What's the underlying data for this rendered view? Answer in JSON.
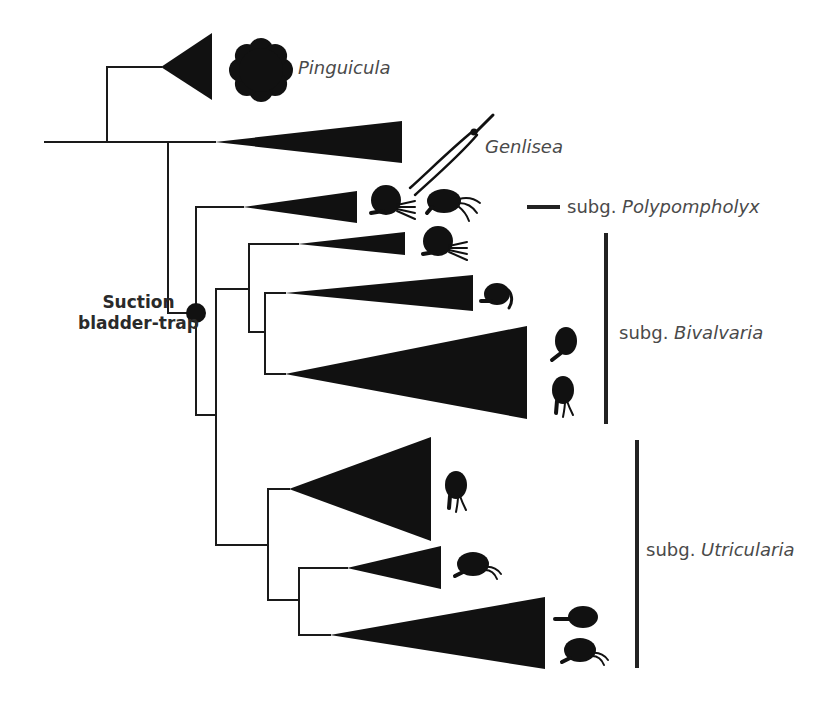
{
  "figure": {
    "width": 824,
    "height": 704,
    "line_color": "#1a1a1a",
    "fill_color": "#111111",
    "text_color": "#4a4a4a"
  },
  "tree": {
    "root_stem": {
      "x1": 45,
      "x2": 107,
      "y": 142
    },
    "branches": [
      {
        "name": "root-split",
        "vx": 107,
        "y1": 67,
        "y2": 142,
        "children_y": [
          67,
          142
        ]
      },
      {
        "name": "genlisea-utricularia-split",
        "vx": 168,
        "y1": 142,
        "y2": 313
      },
      {
        "name": "utricularia-crown",
        "vx": 196,
        "y1": 207,
        "y2": 415
      },
      {
        "name": "bivalvaria-utricularia-split",
        "vx": 216,
        "y1": 289,
        "y2": 545
      },
      {
        "name": "bivalvaria-crown",
        "vx": 249,
        "y1": 244,
        "y2": 332
      },
      {
        "name": "bivalvaria-inner",
        "vx": 265,
        "y1": 293,
        "y2": 374
      },
      {
        "name": "utricularia-subg-crown",
        "vx": 268,
        "y1": 489,
        "y2": 600
      },
      {
        "name": "utricularia-inner",
        "vx": 299,
        "y1": 568,
        "y2": 635
      }
    ],
    "clades": [
      {
        "id": "pinguicula",
        "stem_x": 107,
        "apex_x": 161,
        "apex_y": 67,
        "base_x": 212,
        "top_y": 33,
        "bottom_y": 100
      },
      {
        "id": "genlisea",
        "stem_x": 168,
        "apex_x": 215,
        "apex_y": 142,
        "base_x": 402,
        "top_y": 121,
        "bottom_y": 163
      },
      {
        "id": "polypompholyx",
        "stem_x": 196,
        "apex_x": 243,
        "apex_y": 207,
        "base_x": 357,
        "top_y": 191,
        "bottom_y": 223
      },
      {
        "id": "bivalvaria-1",
        "stem_x": 249,
        "apex_x": 298,
        "apex_y": 244,
        "base_x": 405,
        "top_y": 232,
        "bottom_y": 255
      },
      {
        "id": "bivalvaria-2",
        "stem_x": 265,
        "apex_x": 285,
        "apex_y": 293,
        "base_x": 473,
        "top_y": 275,
        "bottom_y": 311
      },
      {
        "id": "bivalvaria-3",
        "stem_x": 265,
        "apex_x": 285,
        "apex_y": 374,
        "base_x": 527,
        "top_y": 326,
        "bottom_y": 419
      },
      {
        "id": "utricularia-1",
        "stem_x": 268,
        "apex_x": 289,
        "apex_y": 489,
        "base_x": 431,
        "top_y": 437,
        "bottom_y": 541
      },
      {
        "id": "utricularia-2",
        "stem_x": 299,
        "apex_x": 347,
        "apex_y": 568,
        "base_x": 441,
        "top_y": 546,
        "bottom_y": 589
      },
      {
        "id": "utricularia-3",
        "stem_x": 299,
        "apex_x": 330,
        "apex_y": 635,
        "base_x": 545,
        "top_y": 597,
        "bottom_y": 669
      }
    ],
    "node_marker": {
      "cx": 196,
      "cy": 313,
      "r": 10
    }
  },
  "labels": {
    "pinguicula": {
      "text": "Pinguicula",
      "x": 298,
      "y": 57
    },
    "genlisea": {
      "text": "Genlisea",
      "x": 485,
      "y": 136
    },
    "node": {
      "line1": "Suction",
      "line2": "bladder-trap",
      "x": 78,
      "y": 292
    },
    "polypompholyx": {
      "prefix": "subg. ",
      "name": "Polypompholyx",
      "x": 567,
      "y": 196
    },
    "bivalvaria": {
      "prefix": "subg. ",
      "name": "Bivalvaria",
      "x": 619,
      "y": 322
    },
    "utricularia": {
      "prefix": "subg. ",
      "name": "Utricularia",
      "x": 646,
      "y": 539
    }
  },
  "brackets": [
    {
      "id": "polypompholyx-bracket",
      "x1": 527,
      "x2": 560,
      "y1": 207,
      "y2": 207,
      "width": 4
    },
    {
      "id": "bivalvaria-bracket",
      "x1": 606,
      "x2": 606,
      "y1": 233,
      "y2": 424,
      "width": 4
    },
    {
      "id": "utricularia-bracket",
      "x1": 637,
      "x2": 637,
      "y1": 440,
      "y2": 668,
      "width": 4
    }
  ],
  "trap_icons": [
    {
      "id": "pinguicula-leaf-rosette",
      "type": "flower",
      "cx": 261,
      "cy": 70
    },
    {
      "id": "genlisea-eel-trap",
      "type": "genlisea",
      "cx": 455,
      "cy": 155
    },
    {
      "id": "polypompholyx-trap-1",
      "type": "trap-dense",
      "cx": 389,
      "cy": 203,
      "stalk": "left"
    },
    {
      "id": "polypompholyx-trap-2",
      "type": "trap-oval",
      "cx": 447,
      "cy": 201
    },
    {
      "id": "bivalvaria-1-trap",
      "type": "trap-dense",
      "cx": 441,
      "cy": 244,
      "stalk": "left"
    },
    {
      "id": "bivalvaria-2-trap",
      "type": "trap-beak",
      "cx": 497,
      "cy": 294
    },
    {
      "id": "bivalvaria-3-trap-1",
      "type": "trap-upright",
      "cx": 564,
      "cy": 344
    },
    {
      "id": "bivalvaria-3-trap-2",
      "type": "trap-upright-legs",
      "cx": 561,
      "cy": 395
    },
    {
      "id": "utricularia-1-trap",
      "type": "trap-upright-legs",
      "cx": 454,
      "cy": 490
    },
    {
      "id": "utricularia-2-trap",
      "type": "trap-oval-side",
      "cx": 473,
      "cy": 566
    },
    {
      "id": "utricularia-3-trap-1",
      "type": "trap-oval-flat",
      "cx": 583,
      "cy": 617
    },
    {
      "id": "utricularia-3-trap-2",
      "type": "trap-oval-side",
      "cx": 580,
      "cy": 652
    }
  ]
}
